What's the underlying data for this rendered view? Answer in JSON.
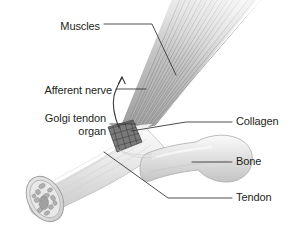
{
  "figure": {
    "width": 289,
    "height": 230,
    "background_color": "#ffffff",
    "style": "grayscale anatomical line illustration"
  },
  "labels": {
    "muscles": {
      "text": "Muscles",
      "side": "left",
      "x": 100,
      "y": 27
    },
    "afferent_nerve": {
      "text": "Afferent nerve",
      "side": "left",
      "x": 112,
      "y": 92
    },
    "golgi_tendon_organ": {
      "line1": "Golgi tendon",
      "line2": "organ",
      "side": "left",
      "x": 106,
      "y": 120
    },
    "collagen": {
      "text": "Collagen",
      "side": "right",
      "x": 238,
      "y": 118
    },
    "bone": {
      "text": "Bone",
      "side": "right",
      "x": 238,
      "y": 158
    },
    "tendon": {
      "text": "Tendon",
      "side": "right",
      "x": 238,
      "y": 197
    }
  },
  "anatomy": {
    "muscle_fan": {
      "name": "muscle-fiber-fan",
      "description": "striated muscle fibers fanning from lower-left to upper-right, fading at the top",
      "fiber_count": 34,
      "color_dark": "#8e8e8e",
      "color_light": "#d8d8d8"
    },
    "golgi_organ": {
      "name": "golgi-tendon-organ-body",
      "description": "dark crosshatched quadrilateral patch at the muscle-tendon junction",
      "color": "#6d6d6d"
    },
    "afferent_nerve_fiber": {
      "name": "afferent-nerve-fiber",
      "description": "thin curved nerve line with an upward-pointing arrowhead indicating signal direction",
      "color": "#3a3a3a"
    },
    "tendon_body": {
      "name": "tendon-cylinder",
      "description": "pale cylindrical tendon angled down to the lower left",
      "color": "#e4e4e4"
    },
    "tendon_cross_section": {
      "name": "tendon-cross-section",
      "description": "circular cut end of the tendon showing collagen fascicle bundles",
      "color": "#d0d0d0"
    },
    "bone_body": {
      "name": "bone-shaft",
      "description": "light gray bone shaft with a flared articular end on the right",
      "color": "#dcdcdc"
    }
  },
  "leader_lines": {
    "color": "#3a3a3a",
    "width": 0.9
  }
}
